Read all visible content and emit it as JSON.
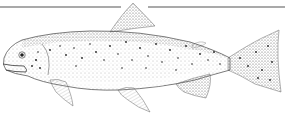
{
  "illustration": {
    "subject": "trout",
    "style": "stippled line drawing",
    "colors": {
      "background": "#ffffff",
      "ink": "#333333",
      "rule": "#555555",
      "spots": "#222222"
    }
  }
}
